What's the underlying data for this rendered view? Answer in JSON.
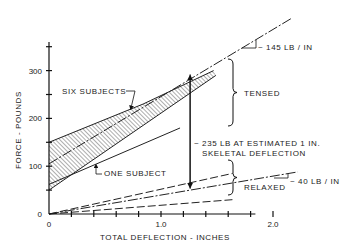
{
  "chart_data": {
    "type": "line",
    "title": "",
    "xlabel": "TOTAL DEFLECTION - INCHES",
    "ylabel": "FORCE - POUNDS",
    "xlim": [
      0,
      2.2
    ],
    "ylim": [
      0,
      360
    ],
    "x_ticks": [
      0,
      0.2,
      0.4,
      0.6,
      0.8,
      1.0,
      1.2,
      1.4,
      1.6,
      1.8,
      2.0
    ],
    "x_tick_labels": [
      {
        "v": 0,
        "t": "0"
      },
      {
        "v": 1.0,
        "t": "1.0"
      },
      {
        "v": 2.0,
        "t": "2.0"
      }
    ],
    "y_ticks": [
      0,
      50,
      100,
      150,
      200,
      250,
      300,
      350
    ],
    "y_tick_labels": [
      {
        "v": 0,
        "t": "0"
      },
      {
        "v": 100,
        "t": "100"
      },
      {
        "v": 200,
        "t": "200"
      },
      {
        "v": 300,
        "t": "300"
      }
    ],
    "grid": false,
    "series": [
      {
        "name": "Six subjects upper bound (tensed)",
        "style": "solid",
        "x": [
          0,
          0.84,
          1.47
        ],
        "y": [
          150,
          230,
          300
        ]
      },
      {
        "name": "Six subjects lower bound (tensed)",
        "style": "solid",
        "x": [
          0,
          1.49
        ],
        "y": [
          50,
          290
        ]
      },
      {
        "name": "Tensed mean (~145 lb/in)",
        "style": "dashdot",
        "x": [
          0,
          2.17
        ],
        "y": [
          105,
          410
        ]
      },
      {
        "name": "One subject",
        "style": "solid",
        "x": [
          0,
          1.17
        ],
        "y": [
          62,
          180
        ]
      },
      {
        "name": "Relaxed upper bound",
        "style": "dashed",
        "x": [
          0,
          1.64
        ],
        "y": [
          0,
          85
        ]
      },
      {
        "name": "Relaxed mean (~40 lb/in)",
        "style": "dashdot",
        "x": [
          0,
          2.22
        ],
        "y": [
          0,
          88
        ]
      },
      {
        "name": "Relaxed lower bound",
        "style": "dashed",
        "x": [
          0,
          1.64
        ],
        "y": [
          0,
          30
        ]
      }
    ],
    "shaded_band": {
      "name": "Six subjects",
      "upper_series": 0,
      "lower_series": 1
    },
    "annotations": {
      "six_subjects": "SIX SUBJECTS",
      "one_subject": "ONE SUBJECT",
      "tensed": "TENSED",
      "relaxed": "RELAXED",
      "slope_tensed": "~ 145 LB / IN",
      "slope_relaxed": "~ 40 LB / IN",
      "difference_line1": "~ 235 LB AT ESTIMATED 1 IN.",
      "difference_line2": "SKELETAL DEFLECTION",
      "difference_x": 1.26,
      "difference_from": 53,
      "difference_to": 292
    }
  }
}
